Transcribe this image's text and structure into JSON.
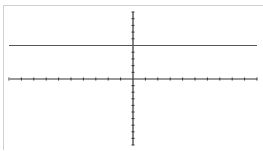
{
  "chart_data": {
    "type": "line",
    "title": "",
    "xlabel": "",
    "ylabel": "",
    "xlim": [
      -10,
      10
    ],
    "ylim": [
      -10,
      10
    ],
    "x_ticks": [
      -10,
      -9,
      -8,
      -7,
      -6,
      -5,
      -4,
      -3,
      -2,
      -1,
      0,
      1,
      2,
      3,
      4,
      5,
      6,
      7,
      8,
      9,
      10
    ],
    "y_ticks": [
      -10,
      -9,
      -8,
      -7,
      -6,
      -5,
      -4,
      -3,
      -2,
      -1,
      0,
      1,
      2,
      3,
      4,
      5,
      6,
      7,
      8,
      9,
      10
    ],
    "grid": false,
    "legend": null,
    "series": [
      {
        "name": "y = 5",
        "x": [
          -10,
          10
        ],
        "y": [
          5,
          5
        ],
        "color": "#555555"
      }
    ]
  },
  "colors": {
    "axis": "#333333",
    "line": "#555555",
    "frame": "#d0d0d0"
  }
}
